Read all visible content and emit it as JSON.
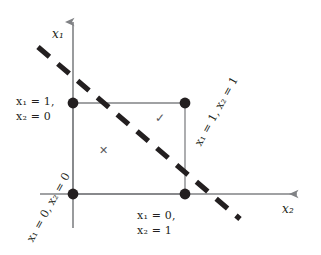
{
  "figure": {
    "title": "",
    "background_color": "#ffffff",
    "axis_color": "#808285",
    "vertex_color": "#231f20",
    "dash_color": "#231f20",
    "mark_color": "#58595b"
  },
  "axes": {
    "y_axis_label": "x₁",
    "x_axis_label": "x₂",
    "y_axis_name": "x1",
    "x_axis_name": "x2"
  },
  "vertices": [
    {
      "id": "top-left",
      "label_line1": "x₁ = 1,",
      "label_line2": "x₂ = 0",
      "rotation": 0
    },
    {
      "id": "top-right",
      "label_line1": "x₁ = 1, x₂ = 1",
      "label_line2": "",
      "rotation": -61
    },
    {
      "id": "bottom-left",
      "label_line1": "x₁ = 0, x₂ = 0",
      "label_line2": "",
      "rotation": -61
    },
    {
      "id": "bottom-right",
      "label_line1": "x₁ = 0,",
      "label_line2": "x₂ = 1",
      "rotation": 0
    }
  ],
  "marks": {
    "check": "✓",
    "cross": "✕"
  },
  "separator": {
    "style": "dashed",
    "slope_description": "-45 degrees"
  }
}
